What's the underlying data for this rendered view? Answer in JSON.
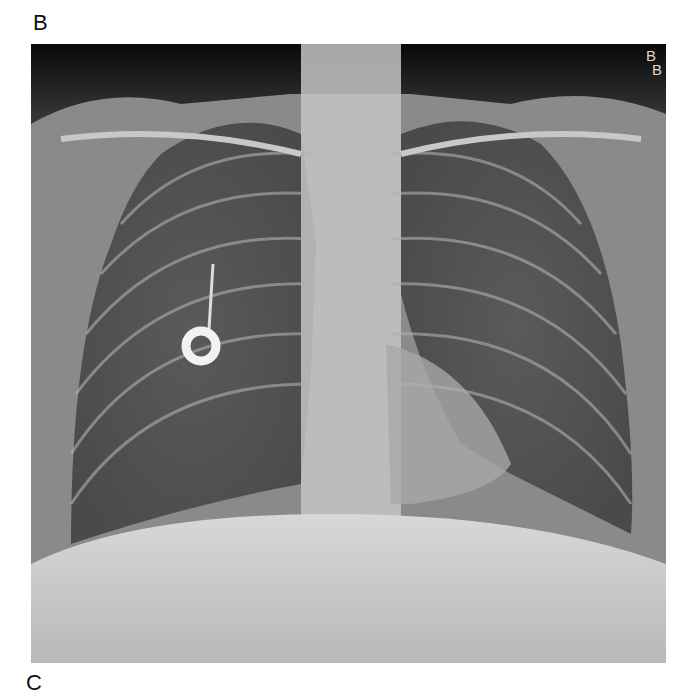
{
  "figure": {
    "panel_labels": {
      "top": "B",
      "bottom": "C"
    },
    "image": {
      "description": "Frontal (PA) chest radiograph",
      "side_markers": [
        "B",
        "B"
      ],
      "findings": [
        "ring-shaped radiopaque device projected over right mid lung"
      ]
    }
  }
}
